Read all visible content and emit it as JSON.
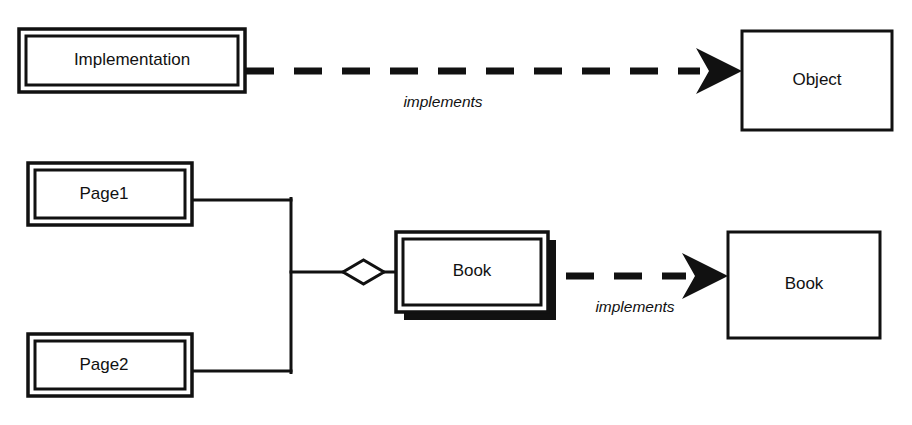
{
  "diagram": {
    "colors": {
      "stroke": "#111111",
      "fill": "#ffffff",
      "shadow": "#111111"
    },
    "nodes": {
      "implementation": {
        "label": "Implementation",
        "style": "double-border"
      },
      "object": {
        "label": "Object",
        "style": "single-border"
      },
      "page1": {
        "label": "Page1",
        "style": "double-border"
      },
      "page2": {
        "label": "Page2",
        "style": "double-border"
      },
      "book_impl": {
        "label": "Book",
        "style": "double-border-shadow"
      },
      "book_iface": {
        "label": "Book",
        "style": "single-border"
      }
    },
    "edges": {
      "implements_top": {
        "label": "implements",
        "style": "dashed-arrow",
        "from": "implementation",
        "to": "object"
      },
      "implements_bottom": {
        "label": "implements",
        "style": "dashed-arrow",
        "from": "book_impl",
        "to": "book_iface"
      },
      "aggregation_page1": {
        "label": "",
        "style": "aggregation",
        "from": "book_impl",
        "to": "page1"
      },
      "aggregation_page2": {
        "label": "",
        "style": "aggregation",
        "from": "book_impl",
        "to": "page2"
      }
    },
    "icons": {
      "arrowhead": "solid-arrowhead-icon",
      "diamond": "open-diamond-aggregation-icon"
    }
  }
}
